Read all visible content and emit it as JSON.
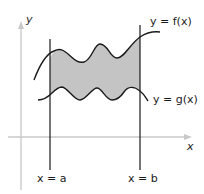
{
  "diagram": {
    "labels": {
      "y_axis": "y",
      "x_axis": "x",
      "upper_curve": "y = f(x)",
      "lower_curve": "y = g(x)",
      "left_bound": "x = a",
      "right_bound": "x = b"
    },
    "colors": {
      "shaded_region": "#c4c4c4",
      "curves": "#1a1a1a",
      "axes": "#c8c8c8"
    }
  }
}
